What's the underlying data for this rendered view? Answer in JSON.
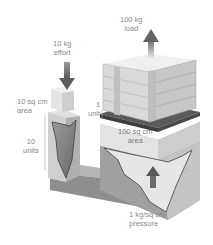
{
  "diagram": {
    "labels": {
      "load": {
        "line1": "100 kg",
        "line2": "load"
      },
      "effort": {
        "line1": "10 kg",
        "line2": "effort"
      },
      "small_area": {
        "line1": "10 sq cm",
        "line2": "area"
      },
      "small_distance": {
        "line1": "10",
        "line2": "units"
      },
      "large_distance": {
        "line1": "1",
        "line2": "unit"
      },
      "large_area": {
        "line1": "100 sq cm",
        "line2": "area"
      },
      "pressure": {
        "line1": "1 kg/sq cm",
        "line2": "pressure"
      }
    },
    "colors": {
      "background": "#ffffff",
      "arrow": "#6e6e6e",
      "fluid_dark": "#7c7c7c",
      "fluid_mid": "#a8a8a8",
      "container_light": "#d8d8d8",
      "piston": "#e6e6e6",
      "crate": "#d2d2d2",
      "label_text": "#8a8a8a"
    }
  }
}
